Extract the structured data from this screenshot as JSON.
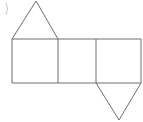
{
  "figure": {
    "canvas": {
      "width": 143,
      "height": 122
    },
    "colors": {
      "stroke": "#6e6e73",
      "fill": "#ffffff",
      "background": "#ffffff",
      "artifact": "#c8c8cc"
    },
    "stroke_width": 1,
    "geometry": {
      "row_top_y": 39,
      "row_bottom_y": 83,
      "x_divisions": [
        12,
        58,
        96,
        141
      ],
      "square_width": 45,
      "square_height": 44
    },
    "shapes": [
      {
        "name": "square-left",
        "type": "square",
        "points": "12,39 58,39 58,83 12,83"
      },
      {
        "name": "square-middle",
        "type": "square",
        "points": "58,39 96,39 96,83 58,83"
      },
      {
        "name": "square-right",
        "type": "square",
        "points": "96,39 141,39 141,83 96,83"
      },
      {
        "name": "triangle-top",
        "type": "triangle",
        "orientation": "up",
        "points": "12,39 36,1 58,39"
      },
      {
        "name": "triangle-bottom",
        "type": "triangle",
        "orientation": "down",
        "points": "96,83 141,83 119,120"
      }
    ],
    "edges": [
      {
        "name": "top-edge",
        "x1": 12,
        "y1": 39,
        "x2": 141,
        "y2": 39
      },
      {
        "name": "bottom-edge",
        "x1": 12,
        "y1": 83,
        "x2": 141,
        "y2": 83
      },
      {
        "name": "left-edge",
        "x1": 12,
        "y1": 39,
        "x2": 12,
        "y2": 83
      },
      {
        "name": "divider-1",
        "x1": 58,
        "y1": 39,
        "x2": 58,
        "y2": 83
      },
      {
        "name": "divider-2",
        "x1": 96,
        "y1": 39,
        "x2": 96,
        "y2": 83
      },
      {
        "name": "right-edge",
        "x1": 141,
        "y1": 39,
        "x2": 141,
        "y2": 83
      },
      {
        "name": "triangle-top-left-side",
        "x1": 12,
        "y1": 39,
        "x2": 36,
        "y2": 1
      },
      {
        "name": "triangle-top-right-side",
        "x1": 36,
        "y1": 1,
        "x2": 58,
        "y2": 39
      },
      {
        "name": "triangle-bottom-left-side",
        "x1": 96,
        "y1": 83,
        "x2": 119,
        "y2": 120
      },
      {
        "name": "triangle-bottom-right-side",
        "x1": 119,
        "y1": 120,
        "x2": 141,
        "y2": 83
      }
    ],
    "artifact": {
      "name": "corner-mark",
      "path": "M 6 3 Q 9 9 6 15"
    }
  }
}
